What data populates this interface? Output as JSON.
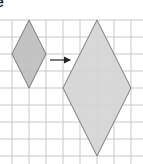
{
  "label": "e",
  "grid": {
    "x_start": 12,
    "y_start": 20,
    "cell": 17,
    "cols": 7,
    "rows": 8,
    "x_lines": [
      12,
      29,
      46,
      63,
      80,
      97,
      114,
      131
    ],
    "y_lines": [
      20,
      37,
      54,
      71,
      88,
      105,
      122,
      139,
      156
    ],
    "color": "#c8c8c8"
  },
  "shapes": {
    "small_rhombus": {
      "points": "29,20 46,54 29,88 12,54",
      "fill": "#bdbdbd",
      "stroke": "#7a7a7a"
    },
    "large_rhombus": {
      "points": "97,20 131,88 97,156 63,88",
      "fill": "#d4d4d4",
      "stroke": "#7a7a7a"
    }
  },
  "arrow": {
    "x1": 50,
    "y1": 60,
    "x2": 70,
    "y2": 60,
    "color": "#222222"
  }
}
